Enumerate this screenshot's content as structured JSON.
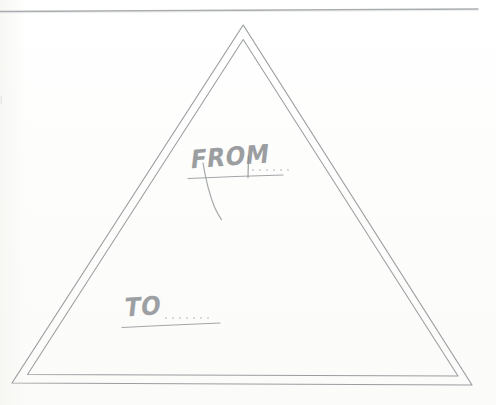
{
  "document": {
    "kind": "scanned-handwritten-form",
    "medium": "paper",
    "background_color": "#fdfdfb",
    "ink_color": "#8c8f92",
    "line_color": "#9a9ea1"
  },
  "scan": {
    "top_edge_line": {
      "name": "paper-top-edge",
      "x_start": 0,
      "x_end": 478,
      "y": 10,
      "color": "#9b9fa2"
    }
  },
  "shape": {
    "name": "triangle",
    "style": "double-outline",
    "stroke_color": "#9a9ea1",
    "stroke_width": 1.1,
    "outer": {
      "apex": [
        243,
        25
      ],
      "bottom_left": [
        12,
        383
      ],
      "bottom_right": [
        472,
        385
      ]
    },
    "inner": {
      "apex": [
        243,
        40
      ],
      "bottom_left": [
        27,
        375
      ],
      "bottom_right": [
        458,
        376
      ]
    }
  },
  "fields": [
    {
      "id": "from",
      "label": "FROM",
      "value": "",
      "placeholder": "",
      "underline": {
        "x_start": 188,
        "x_end": 283,
        "y": 177
      },
      "dots": 6,
      "flourish": "descending-stroke"
    },
    {
      "id": "to",
      "label": "TO",
      "value": "",
      "placeholder": "",
      "underline": {
        "x_start": 122,
        "x_end": 220,
        "y": 325
      },
      "dots": 7,
      "flourish": "none"
    }
  ]
}
